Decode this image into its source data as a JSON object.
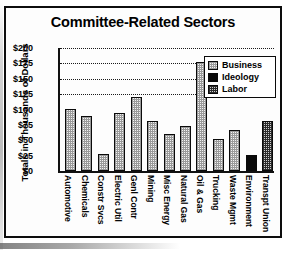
{
  "chart_data": {
    "type": "bar",
    "title": "Committee-Related Sectors",
    "xlabel": "",
    "ylabel": "Totals in Thousands of Dollars",
    "ylim": [
      0,
      200
    ],
    "yticks": [
      "$0",
      "$25",
      "$50",
      "$75",
      "$100",
      "$125",
      "$150",
      "$175",
      "$200"
    ],
    "ytick_values": [
      0,
      25,
      50,
      75,
      100,
      125,
      150,
      175,
      200
    ],
    "grid": true,
    "legend_position": "upper right",
    "categories": [
      "Automotive",
      "Chemicals",
      "Constr Svcs",
      "Electric Util",
      "Genl Contr",
      "Mining",
      "Misc Energy",
      "Natural Gas",
      "Oil & Gas",
      "Trucking",
      "Waste Mgmt",
      "Environment",
      "Transpt Union"
    ],
    "values": [
      100,
      88,
      28,
      93,
      118,
      80,
      60,
      72,
      175,
      52,
      65,
      25,
      80
    ],
    "bar_groups": [
      "business",
      "business",
      "business",
      "business",
      "business",
      "business",
      "business",
      "business",
      "business",
      "business",
      "business",
      "ideology",
      "labor"
    ],
    "legend": [
      {
        "label": "Business",
        "key": "business",
        "color": "#f2f2f2"
      },
      {
        "label": "Ideology",
        "key": "ideology",
        "color": "#0a0a0a"
      },
      {
        "label": "Labor",
        "key": "labor",
        "color": "#cfcfcf"
      }
    ]
  }
}
